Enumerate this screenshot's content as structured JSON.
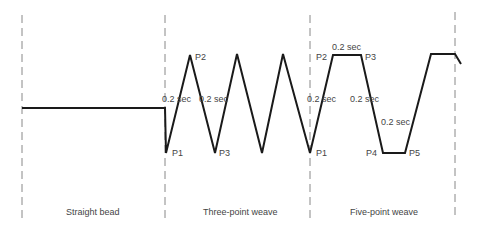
{
  "diagram": {
    "sections": [
      {
        "label": "Straight bead",
        "x": 71
      },
      {
        "label": "Three-point weave",
        "x": 218
      },
      {
        "label": "Five-point weave",
        "x": 362
      }
    ],
    "three_point": {
      "points": {
        "p1": "P1",
        "p2": "P2",
        "p3": "P3"
      },
      "times": [
        "0.2 sec",
        "0.2 sec"
      ]
    },
    "five_point": {
      "points": {
        "p1": "P1",
        "p2": "P2",
        "p3": "P3",
        "p4": "P4",
        "p5": "P5"
      },
      "times": [
        "0.2 sec",
        "0.2 sec",
        "0.2 sec",
        "0.2 sec"
      ]
    },
    "colors": {
      "line": "#1a1a1a",
      "dash": "#888888",
      "text": "#444444"
    }
  }
}
